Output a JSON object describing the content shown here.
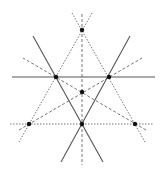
{
  "diagram": {
    "colors": {
      "solid_line": "#555555",
      "dashed_line": "#666666",
      "point": "#111111",
      "background": "#ffffff"
    },
    "points": [
      {
        "id": "top",
        "x": 82,
        "y": 30
      },
      {
        "id": "upper-left",
        "x": 56,
        "y": 77
      },
      {
        "id": "upper-right",
        "x": 109,
        "y": 77
      },
      {
        "id": "center",
        "x": 82,
        "y": 92
      },
      {
        "id": "bottom-left",
        "x": 29,
        "y": 124
      },
      {
        "id": "bottom-center",
        "x": 82,
        "y": 124
      },
      {
        "id": "bottom-right",
        "x": 135,
        "y": 124
      }
    ],
    "solid_lines": [
      {
        "id": "horizontal",
        "x1": 12,
        "y1": 77,
        "x2": 155,
        "y2": 77
      },
      {
        "id": "diag-left",
        "x1": 33,
        "y1": 36,
        "x2": 103,
        "y2": 162
      },
      {
        "id": "diag-right",
        "x1": 130,
        "y1": 36,
        "x2": 61,
        "y2": 162
      }
    ],
    "dashed_lines": [
      {
        "id": "vertical",
        "style": "long",
        "x1": 82,
        "y1": 14,
        "x2": 82,
        "y2": 165
      },
      {
        "id": "horizontal-bottom",
        "style": "short",
        "x1": 10,
        "y1": 124,
        "x2": 153,
        "y2": 124
      },
      {
        "id": "top-to-bottom-left",
        "style": "short",
        "x1": 92,
        "y1": 13,
        "x2": 19,
        "y2": 142
      },
      {
        "id": "top-to-bottom-right",
        "style": "short",
        "x1": 72,
        "y1": 13,
        "x2": 145,
        "y2": 142
      },
      {
        "id": "bottom-left-rising",
        "style": "long",
        "x1": 19,
        "y1": 130,
        "x2": 142,
        "y2": 58
      },
      {
        "id": "bottom-right-rising",
        "style": "long",
        "x1": 146,
        "y1": 130,
        "x2": 23,
        "y2": 58
      }
    ]
  }
}
